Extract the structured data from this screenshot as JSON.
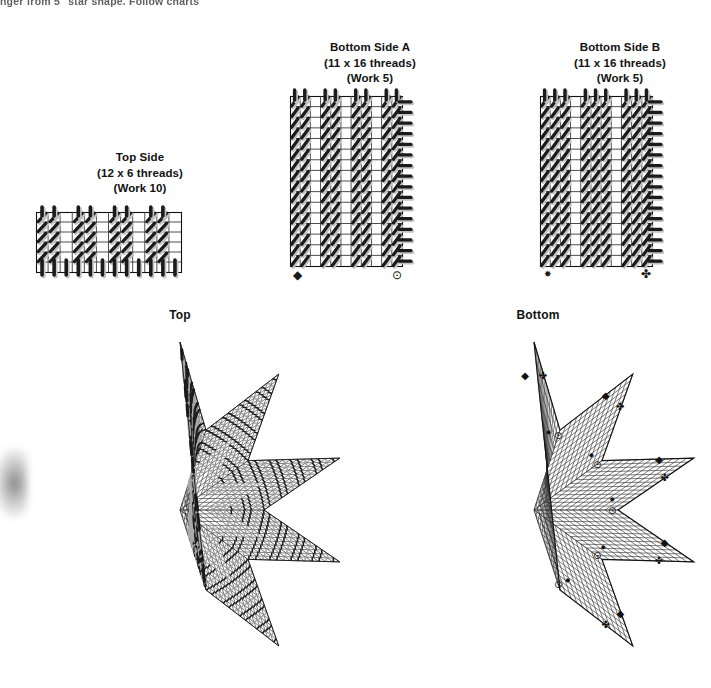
{
  "page": {
    "instruction_text": "nger from 5\" star shape. Follow charts",
    "background_color": "#ffffff",
    "ink_color": "#111111"
  },
  "charts": [
    {
      "id": "top-side",
      "name": "Top Side",
      "threads_label": "(12 x 6 threads)",
      "work_label": "(Work 10)",
      "cols": 12,
      "rows": 6,
      "stitch_style": "diagonal",
      "markers": []
    },
    {
      "id": "bottom-side-a",
      "name": "Bottom Side A",
      "threads_label": "(11 x 16 threads)",
      "work_label": "(Work 5)",
      "cols": 11,
      "rows": 16,
      "stitch_style": "diagonal",
      "markers": [
        {
          "symbol": "filled-diamond",
          "position": "bottom-left"
        },
        {
          "symbol": "circle-dot",
          "position": "bottom-right"
        }
      ]
    },
    {
      "id": "bottom-side-b",
      "name": "Bottom Side B",
      "threads_label": "(11 x 16 threads)",
      "work_label": "(Work 5)",
      "cols": 11,
      "rows": 16,
      "stitch_style": "diagonal-dense",
      "markers": [
        {
          "symbol": "small-asterisk",
          "position": "bottom-left"
        },
        {
          "symbol": "plus-cross",
          "position": "bottom-right"
        }
      ]
    }
  ],
  "assemblies": [
    {
      "id": "top-star",
      "title": "Top",
      "points": 5,
      "style": "stitched",
      "markers": []
    },
    {
      "id": "bottom-star",
      "title": "Bottom",
      "points": 5,
      "style": "grid",
      "markers": [
        {
          "symbol": "filled-diamond",
          "at": "tip-1-left"
        },
        {
          "symbol": "plus-cross",
          "at": "tip-1-right"
        },
        {
          "symbol": "circle-dot",
          "at": "valley-1-left"
        },
        {
          "symbol": "small-asterisk",
          "at": "valley-1-left-outer"
        },
        {
          "symbol": "small-asterisk",
          "at": "valley-2-right-outer"
        },
        {
          "symbol": "circle-dot",
          "at": "valley-2-right"
        },
        {
          "symbol": "plus-cross",
          "at": "tip-2-upper"
        },
        {
          "symbol": "filled-diamond",
          "at": "tip-2-lower"
        },
        {
          "symbol": "filled-diamond",
          "at": "tip-5-upper"
        },
        {
          "symbol": "plus-cross",
          "at": "tip-5-lower"
        },
        {
          "symbol": "circle-dot",
          "at": "valley-3-left"
        },
        {
          "symbol": "small-asterisk",
          "at": "valley-3-left-lower"
        },
        {
          "symbol": "small-asterisk",
          "at": "valley-4-right-upper"
        },
        {
          "symbol": "circle-dot",
          "at": "valley-4-right"
        },
        {
          "symbol": "plus-cross",
          "at": "tip-3-upper"
        },
        {
          "symbol": "filled-diamond",
          "at": "tip-3-lower"
        },
        {
          "symbol": "filled-diamond",
          "at": "tip-4-upper"
        },
        {
          "symbol": "plus-cross",
          "at": "tip-4-lower"
        },
        {
          "symbol": "circle-dot",
          "at": "valley-5-center"
        },
        {
          "symbol": "small-asterisk",
          "at": "valley-5-center-right"
        }
      ]
    }
  ],
  "symbol_glyphs": {
    "filled-diamond": "◆",
    "circle-dot": "⊙",
    "plus-cross": "✤",
    "small-asterisk": "✸"
  }
}
